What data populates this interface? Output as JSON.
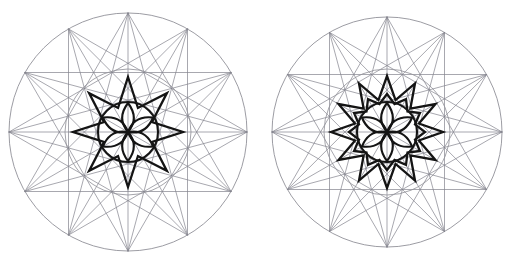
{
  "page": {
    "background_color": "#ffffff",
    "width": 517,
    "height": 265
  },
  "style": {
    "construction_line_color": "#83838c",
    "construction_line_width": 0.7,
    "pattern_line_color": "#141414",
    "pattern_line_width": 2.3,
    "rosette_line_width": 2.1,
    "outer_circle_color": "#8a8a92",
    "mid_circle_color": "#93939b"
  },
  "figures": [
    {
      "id": "figure-left",
      "label": "Left construction",
      "center": {
        "x": 128,
        "y": 132
      },
      "outer_circle_radius": 119,
      "mid_circle_radius": 63,
      "division_points": 12,
      "division_angle_degrees": 30,
      "construction_star_skip": 5,
      "construction_star_skip_secondary": 4,
      "pattern": {
        "type": "star-polygon",
        "points": 8,
        "outer_radius": 55,
        "inner_radius": 26,
        "rotation_degrees": -90,
        "description": "Bold eight-pointed star"
      },
      "rosette": {
        "type": "petal-rosette",
        "petals": 6,
        "radius": 29,
        "hub_radius": 15,
        "ring_radius": 30,
        "spokes": 6,
        "description": "Six-petal rosette inside circle"
      }
    },
    {
      "id": "figure-right",
      "label": "Right construction",
      "center": {
        "x": 387,
        "y": 132
      },
      "outer_circle_radius": 115,
      "mid_circle_radius": 63,
      "division_points": 12,
      "division_angle_degrees": 30,
      "construction_star_skip": 5,
      "construction_star_skip_secondary": 4,
      "pattern": {
        "type": "star-polygon",
        "points": 12,
        "outer_radius": 56,
        "inner_radius": 33,
        "rotation_degrees": -90,
        "description": "Bold twelve-pointed star"
      },
      "inner_ring": {
        "type": "star-polygon",
        "points": 12,
        "outer_radius": 38,
        "inner_radius": 29,
        "rotation_degrees": -90,
        "description": "Twelve-point serrated ring"
      },
      "rosette": {
        "type": "petal-rosette",
        "petals": 6,
        "radius": 29,
        "hub_radius": 15,
        "ring_radius": 30,
        "spokes": 6,
        "description": "Six-petal rosette inside circle"
      }
    }
  ]
}
